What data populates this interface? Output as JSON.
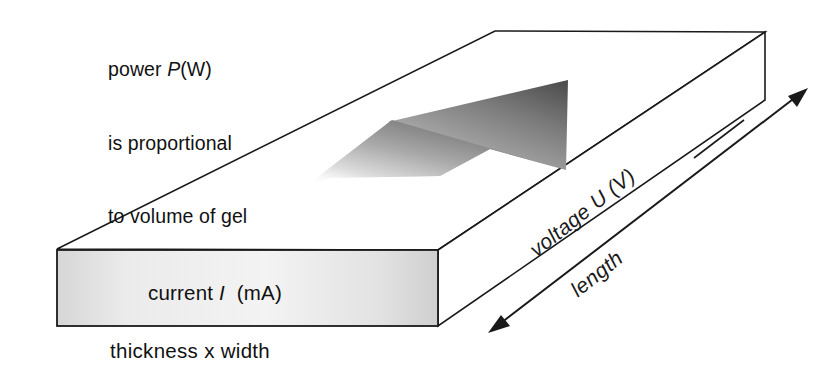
{
  "diagram": {
    "background_color": "#ffffff",
    "stroke_color": "#1a1a1a",
    "front_face_color_light": "#f2f2f2",
    "front_face_color_dark": "#c9c9c9",
    "gradient_arrow_color_dark": "#5a5a5a",
    "gradient_arrow_color_light": "#e8e8e8"
  },
  "annotations": {
    "power_note": {
      "line1_pre": "power ",
      "line1_symbol": "P",
      "line1_post": "(W)",
      "line2": "is proportional",
      "line3": "to volume of gel"
    },
    "current_label": {
      "pre": "current ",
      "symbol": "I",
      "post": "  (mA)"
    },
    "thickness_label": "thickness x width",
    "voltage_label": {
      "pre": "voltage ",
      "symbol": "U",
      "post": " (V)"
    },
    "length_label": "length"
  },
  "geometry": {
    "front_face": {
      "x": 57,
      "y": 250,
      "w": 381,
      "h": 76
    },
    "top_face_points": "57,249 495,31 765,32 438,250",
    "right_face_points": "438,250 765,32 765,100 438,326",
    "dimension_arrow": {
      "from_x": 490,
      "from_y": 332,
      "to_x": 808,
      "to_y": 88,
      "double_headed": true
    },
    "flow_arrow": {
      "tip_x": 568,
      "tip_y": 80,
      "direction": "up-right",
      "style": "gradient-fade"
    }
  }
}
